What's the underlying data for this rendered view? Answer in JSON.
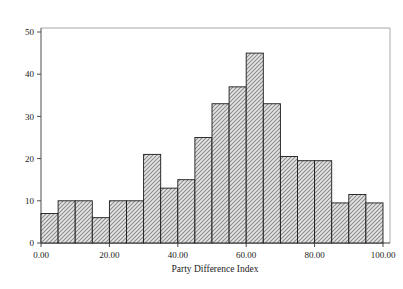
{
  "chart_data": {
    "type": "bar",
    "title": "",
    "subtitle": "",
    "xlabel": "Party Difference Index",
    "ylabel": "",
    "xlim": [
      0,
      100
    ],
    "ylim": [
      0,
      52
    ],
    "grid": false,
    "legend": null,
    "bin_width": 5,
    "categories": [
      "0-5",
      "5-10",
      "10-15",
      "15-20",
      "20-25",
      "25-30",
      "30-35",
      "35-40",
      "40-45",
      "45-50",
      "50-55",
      "55-60",
      "60-65",
      "65-70",
      "70-75",
      "75-80",
      "80-85",
      "85-90",
      "90-95",
      "95-100"
    ],
    "bin_edges": [
      0,
      5,
      10,
      15,
      20,
      25,
      30,
      35,
      40,
      45,
      50,
      55,
      60,
      65,
      70,
      75,
      80,
      85,
      90,
      95,
      100
    ],
    "values": [
      7,
      10,
      10,
      6,
      10,
      10,
      21,
      13,
      15,
      25,
      33,
      37,
      45,
      33,
      20.5,
      19.5,
      19.5,
      9.5,
      11.5,
      9.5
    ],
    "xticks": [
      0,
      20,
      40,
      60,
      80,
      100
    ],
    "xtick_labels": [
      "0.00",
      "20.00",
      "40.00",
      "60.00",
      "80.00",
      "100.00"
    ],
    "yticks": [
      0,
      10,
      20,
      30,
      40,
      50
    ],
    "ytick_labels": [
      "0",
      "10",
      "20",
      "30",
      "40",
      "50"
    ],
    "bar_fill": "#b8b8b8",
    "bar_edge": "#1a1a1a",
    "axis_color": "#4d4d4d",
    "frame_color": "#9a9a9a",
    "hatch": "crosshatch-dither"
  },
  "axis_labels": {
    "x_title": "Party Difference Index"
  }
}
